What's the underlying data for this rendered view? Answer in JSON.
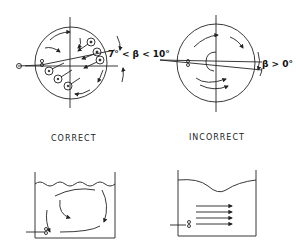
{
  "figure": {
    "panels": [
      {
        "id": "top-left",
        "label": "CORRECT",
        "view": "plan",
        "angle_label": "7° < β < 10°",
        "description": "Circular tank plan view with jet inlet angled inward, producing rotating flow"
      },
      {
        "id": "top-right",
        "label": "INCORRECT",
        "view": "plan",
        "angle_label": "β > 0°",
        "description": "Circular tank plan view with concentric swirl flow"
      },
      {
        "id": "bottom-left",
        "label": "CORRECT",
        "view": "section",
        "description": "Side section with circulating loop flow and rippled surface"
      },
      {
        "id": "bottom-right",
        "label": "INCORRECT",
        "view": "section",
        "description": "Side section with parallel jet streams and depressed surface"
      }
    ],
    "labels": {
      "correct": "CORRECT",
      "incorrect": "INCORRECT",
      "angle_correct": "7° < β < 10°",
      "angle_incorrect": "β > 0°"
    },
    "colors": {
      "ink": "#222222",
      "background": "#ffffff"
    }
  }
}
